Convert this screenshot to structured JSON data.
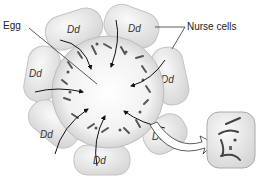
{
  "diagram": {
    "labels": {
      "egg": "Egg",
      "nurse_cells": "Nurse cells"
    },
    "nurse_cell_genotype": "Dd",
    "nurse_cells": [
      {
        "id": "top-left",
        "label": "Dd"
      },
      {
        "id": "top-right",
        "label": "Dd"
      },
      {
        "id": "left-upper",
        "label": "Dd"
      },
      {
        "id": "right-upper",
        "label": "Dd"
      },
      {
        "id": "left-lower",
        "label": "Dd"
      },
      {
        "id": "right-lower",
        "label": "Dd"
      },
      {
        "id": "bottom",
        "label": "Dd"
      }
    ],
    "colors": {
      "cell_fill": "#e6e6e6",
      "cell_stroke": "#c4c4c4",
      "egg_fill": "#eeeeee",
      "arrow": "#111111",
      "chromosome": "#555555"
    }
  }
}
